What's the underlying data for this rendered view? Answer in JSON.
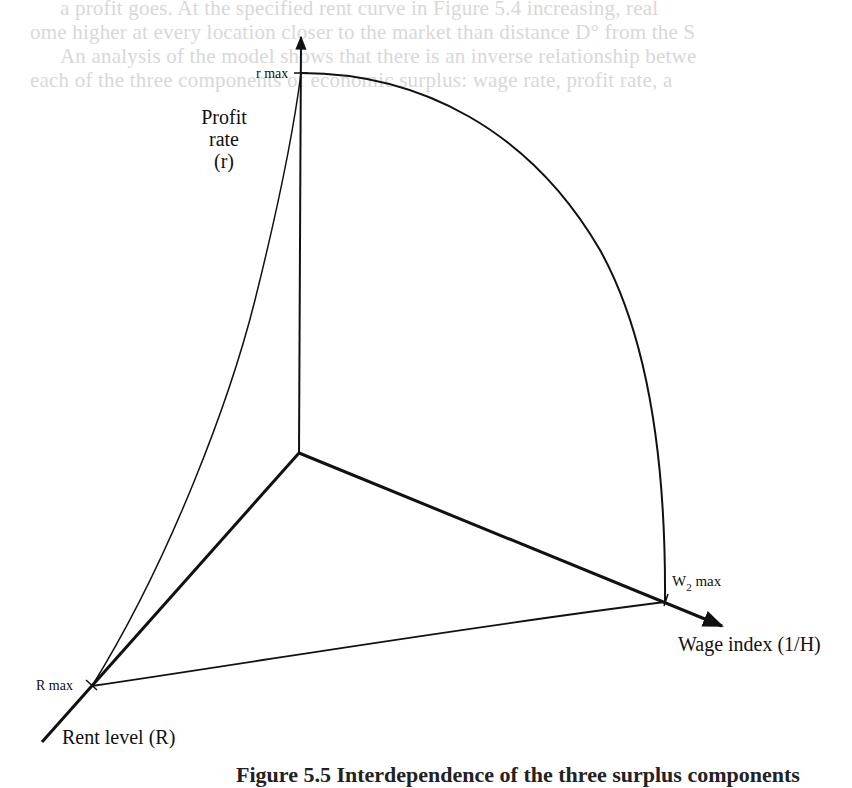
{
  "background_text": {
    "line1": "a profit goes. At the specified rent curve in Figure 5.4 increasing, real",
    "line2": "ome higher at every location closer to the market than distance D° from the S",
    "line3": "An analysis of the model shows that there is an inverse relationship betwe",
    "line4": "each of the three components of economic surplus: wage rate, profit rate, a"
  },
  "diagram": {
    "axes": {
      "profit": {
        "label_line1": "Profit",
        "label_line2": "rate",
        "label_line3": "(r)",
        "max_label": "r max"
      },
      "wage": {
        "label": "Wage index (1/H)",
        "max_label_base": "W",
        "max_label_sub": "2",
        "max_label_suffix": " max"
      },
      "rent": {
        "label": "Rent level (R)",
        "max_label": "R max"
      }
    },
    "geometry": {
      "origin": [
        299,
        453
      ],
      "profit_axis_top": [
        301,
        35
      ],
      "r_max": [
        301,
        73
      ],
      "w2_max": [
        665,
        602
      ],
      "wage_axis_end": [
        722,
        626
      ],
      "r_max_point": [
        92,
        686
      ],
      "rent_axis_end": [
        42,
        742
      ]
    },
    "colors": {
      "ink": "#111111",
      "bleed": "#d8d8d8"
    }
  },
  "caption": {
    "text": "Figure 5.5 Interdependence of the three surplus components"
  }
}
